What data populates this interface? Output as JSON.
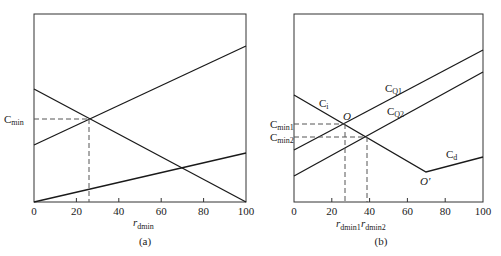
{
  "panels": [
    {
      "id": "a",
      "caption": "(a)",
      "x_ticks": [
        "0",
        "20",
        "40",
        "60",
        "80",
        "100"
      ],
      "x_label": {
        "main": "r",
        "sub": "dmin"
      },
      "y_label": {
        "main": "C",
        "sub": "min"
      }
    },
    {
      "id": "b",
      "caption": "(b)",
      "x_ticks": [
        "0",
        "20",
        "40",
        "60",
        "80",
        "100"
      ],
      "x_labels": [
        {
          "main": "r",
          "sub": "dmin1"
        },
        {
          "main": "r",
          "sub": "dmin2"
        }
      ],
      "y_labels": [
        {
          "main": "C",
          "sub": "min1"
        },
        {
          "main": "C",
          "sub": "min2"
        }
      ],
      "curve_labels": {
        "ci": {
          "main": "C",
          "sub": "i"
        },
        "cq1": {
          "main": "C",
          "sub": "Q1"
        },
        "cq2": {
          "main": "C",
          "sub": "Q2"
        },
        "cd": {
          "main": "C",
          "sub": "d"
        }
      },
      "points": {
        "o": "O",
        "o_prime": "O′"
      }
    }
  ],
  "colors": {
    "line": "#1a1a1a",
    "dashed": "#555555",
    "frame": "#333333"
  }
}
